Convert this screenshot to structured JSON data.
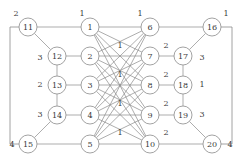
{
  "figure": {
    "title": "",
    "background_color": "#ffffff",
    "node_fill": "#ffffff",
    "node_stroke": "#8a8a8a",
    "edge_stroke": "#8a8a8a",
    "text_color": "#3a3a3a",
    "width": 242,
    "height": 165
  },
  "chart_data": {
    "type": "diagram",
    "diagram_kind": "weighted-graph",
    "nodes": [
      {
        "id": "1",
        "label": "1",
        "x": 90,
        "y": 27,
        "r": 9,
        "column": "inner-left"
      },
      {
        "id": "2",
        "label": "2",
        "x": 90,
        "y": 56,
        "r": 9,
        "column": "inner-left"
      },
      {
        "id": "3",
        "label": "3",
        "x": 90,
        "y": 85,
        "r": 9,
        "column": "inner-left"
      },
      {
        "id": "4",
        "label": "4",
        "x": 90,
        "y": 115,
        "r": 9,
        "column": "inner-left"
      },
      {
        "id": "5",
        "label": "5",
        "x": 90,
        "y": 144,
        "r": 9,
        "column": "inner-left"
      },
      {
        "id": "6",
        "label": "6",
        "x": 150,
        "y": 27,
        "r": 9,
        "column": "inner-right"
      },
      {
        "id": "7",
        "label": "7",
        "x": 150,
        "y": 56,
        "r": 9,
        "column": "inner-right"
      },
      {
        "id": "8",
        "label": "8",
        "x": 150,
        "y": 85,
        "r": 9,
        "column": "inner-right"
      },
      {
        "id": "9",
        "label": "9",
        "x": 150,
        "y": 115,
        "r": 9,
        "column": "inner-right"
      },
      {
        "id": "10",
        "label": "10",
        "x": 150,
        "y": 144,
        "r": 9,
        "column": "inner-right"
      },
      {
        "id": "11",
        "label": "11",
        "x": 28,
        "y": 27,
        "r": 9,
        "column": "outer-left"
      },
      {
        "id": "12",
        "label": "12",
        "x": 57,
        "y": 56,
        "r": 9,
        "column": "outer-left"
      },
      {
        "id": "13",
        "label": "13",
        "x": 57,
        "y": 85,
        "r": 9,
        "column": "outer-left"
      },
      {
        "id": "14",
        "label": "14",
        "x": 57,
        "y": 115,
        "r": 9,
        "column": "outer-left"
      },
      {
        "id": "15",
        "label": "15",
        "x": 28,
        "y": 144,
        "r": 9,
        "column": "outer-left"
      },
      {
        "id": "16",
        "label": "16",
        "x": 212,
        "y": 27,
        "r": 9,
        "column": "outer-right"
      },
      {
        "id": "17",
        "label": "17",
        "x": 183,
        "y": 56,
        "r": 9,
        "column": "outer-right"
      },
      {
        "id": "18",
        "label": "18",
        "x": 183,
        "y": 85,
        "r": 9,
        "column": "outer-right"
      },
      {
        "id": "19",
        "label": "19",
        "x": 183,
        "y": 115,
        "r": 9,
        "column": "outer-right"
      },
      {
        "id": "20",
        "label": "20",
        "x": 212,
        "y": 144,
        "r": 9,
        "column": "outer-right"
      }
    ],
    "edges": [
      {
        "from": "11",
        "to": "1",
        "weight": "1"
      },
      {
        "from": "12",
        "to": "2",
        "weight": "1"
      },
      {
        "from": "13",
        "to": "3",
        "weight": "1"
      },
      {
        "from": "14",
        "to": "4",
        "weight": "1"
      },
      {
        "from": "15",
        "to": "5",
        "weight": "1"
      },
      {
        "from": "6",
        "to": "16",
        "weight": "2"
      },
      {
        "from": "7",
        "to": "17",
        "weight": "2"
      },
      {
        "from": "8",
        "to": "18",
        "weight": "2"
      },
      {
        "from": "9",
        "to": "19",
        "weight": "2"
      },
      {
        "from": "10",
        "to": "20",
        "weight": "2"
      },
      {
        "from": "11",
        "to": "12",
        "weight": "3"
      },
      {
        "from": "12",
        "to": "13",
        "weight": "2"
      },
      {
        "from": "13",
        "to": "14",
        "weight": "3"
      },
      {
        "from": "14",
        "to": "15",
        "weight": ""
      },
      {
        "from": "16",
        "to": "17",
        "weight": "3"
      },
      {
        "from": "17",
        "to": "18",
        "weight": "1"
      },
      {
        "from": "18",
        "to": "19",
        "weight": "3"
      },
      {
        "from": "19",
        "to": "20",
        "weight": ""
      },
      {
        "from": "11",
        "to": "15",
        "weight": ""
      },
      {
        "from": "16",
        "to": "20",
        "weight": ""
      },
      {
        "from": "1",
        "to": "6",
        "weight": ""
      },
      {
        "from": "1",
        "to": "7",
        "weight": ""
      },
      {
        "from": "1",
        "to": "8",
        "weight": ""
      },
      {
        "from": "1",
        "to": "9",
        "weight": ""
      },
      {
        "from": "1",
        "to": "10",
        "weight": ""
      },
      {
        "from": "2",
        "to": "6",
        "weight": ""
      },
      {
        "from": "2",
        "to": "7",
        "weight": ""
      },
      {
        "from": "2",
        "to": "8",
        "weight": ""
      },
      {
        "from": "2",
        "to": "9",
        "weight": ""
      },
      {
        "from": "2",
        "to": "10",
        "weight": ""
      },
      {
        "from": "3",
        "to": "6",
        "weight": ""
      },
      {
        "from": "3",
        "to": "7",
        "weight": ""
      },
      {
        "from": "3",
        "to": "8",
        "weight": ""
      },
      {
        "from": "3",
        "to": "9",
        "weight": ""
      },
      {
        "from": "3",
        "to": "10",
        "weight": ""
      },
      {
        "from": "4",
        "to": "6",
        "weight": ""
      },
      {
        "from": "4",
        "to": "7",
        "weight": ""
      },
      {
        "from": "4",
        "to": "8",
        "weight": ""
      },
      {
        "from": "4",
        "to": "9",
        "weight": ""
      },
      {
        "from": "4",
        "to": "10",
        "weight": ""
      },
      {
        "from": "5",
        "to": "6",
        "weight": ""
      },
      {
        "from": "5",
        "to": "7",
        "weight": ""
      },
      {
        "from": "5",
        "to": "8",
        "weight": ""
      },
      {
        "from": "5",
        "to": "9",
        "weight": ""
      },
      {
        "from": "5",
        "to": "10",
        "weight": ""
      }
    ],
    "edge_labels": [
      {
        "text": "2",
        "x": 16,
        "y": 13,
        "for": "11-top-outer"
      },
      {
        "text": "1",
        "x": 82,
        "y": 13,
        "for": "11-1"
      },
      {
        "text": "1",
        "x": 140,
        "y": 13,
        "for": "6-top"
      },
      {
        "text": "1",
        "x": 226,
        "y": 13,
        "for": "16-top-outer"
      },
      {
        "text": "3",
        "x": 40,
        "y": 57,
        "for": "11-12"
      },
      {
        "text": "1",
        "x": 120,
        "y": 45,
        "for": "2-row"
      },
      {
        "text": "2",
        "x": 166,
        "y": 45,
        "for": "7-17"
      },
      {
        "text": "3",
        "x": 202,
        "y": 57,
        "for": "16-17"
      },
      {
        "text": "2",
        "x": 40,
        "y": 84,
        "for": "12-13"
      },
      {
        "text": "1",
        "x": 120,
        "y": 74,
        "for": "3-row"
      },
      {
        "text": "2",
        "x": 166,
        "y": 74,
        "for": "8-18"
      },
      {
        "text": "1",
        "x": 202,
        "y": 84,
        "for": "17-18"
      },
      {
        "text": "3",
        "x": 40,
        "y": 114,
        "for": "13-14"
      },
      {
        "text": "1",
        "x": 120,
        "y": 103,
        "for": "4-row"
      },
      {
        "text": "2",
        "x": 166,
        "y": 103,
        "for": "9-19"
      },
      {
        "text": "3",
        "x": 202,
        "y": 114,
        "for": "18-19"
      },
      {
        "text": "4",
        "x": 12,
        "y": 144,
        "for": "15-left-outer"
      },
      {
        "text": "1",
        "x": 120,
        "y": 132,
        "for": "5-row"
      },
      {
        "text": "2",
        "x": 166,
        "y": 132,
        "for": "10-20"
      },
      {
        "text": "4",
        "x": 230,
        "y": 144,
        "for": "20-right-outer"
      }
    ]
  }
}
